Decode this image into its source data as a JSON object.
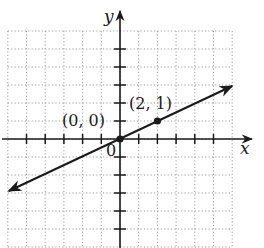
{
  "chart_data": {
    "type": "line",
    "title": "",
    "xlabel": "x",
    "ylabel": "y",
    "xlim": [
      -6,
      6
    ],
    "ylim": [
      -6,
      6
    ],
    "grid": true,
    "grid_style": "dotted",
    "tick_spacing": 1,
    "origin_label": "0",
    "series": [
      {
        "name": "line through origin",
        "equation": "y = x/2",
        "slope": 0.5,
        "intercept": 0,
        "x": [
          -6.0,
          6.0
        ],
        "y": [
          -3.0,
          3.0
        ],
        "arrows": "both"
      }
    ],
    "points": [
      {
        "x": 0,
        "y": 0,
        "label": "(0, 0)"
      },
      {
        "x": 2,
        "y": 1,
        "label": "(2, 1)"
      }
    ],
    "legend": null
  },
  "colors": {
    "axis": "#1a1a1a",
    "grid": "#9a9a9a",
    "line": "#1a1a1a",
    "background": "#ffffff"
  },
  "labels": {
    "x_axis": "x",
    "y_axis": "y",
    "origin": "0",
    "point_origin": "(0, 0)",
    "point_2_1": "(2, 1)"
  }
}
